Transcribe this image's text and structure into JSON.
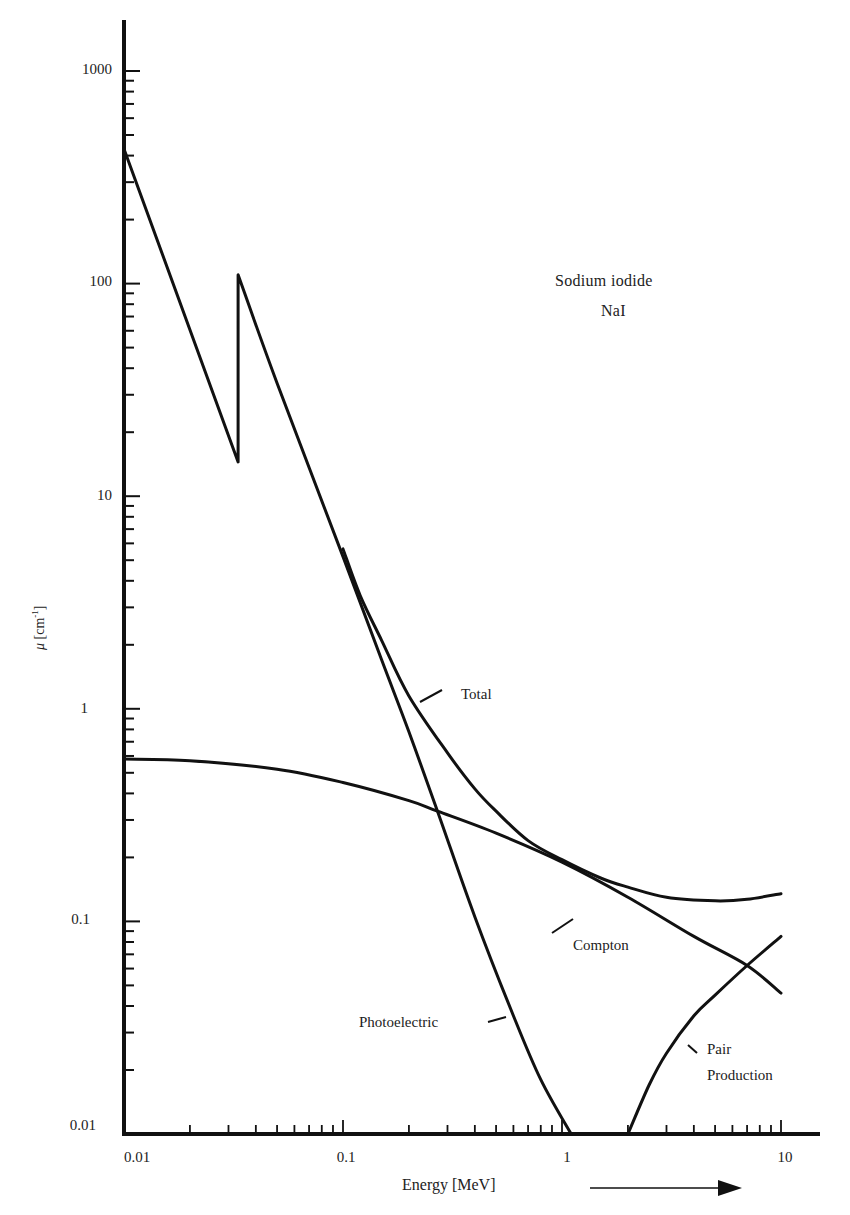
{
  "chart_data": {
    "type": "line",
    "title": "Sodium iodide",
    "subtitle": "NaI",
    "xlabel": "Energy [MeV]",
    "ylabel": "μ [cm⁻¹]",
    "xscale": "log",
    "yscale": "log",
    "xlim": [
      0.01,
      15
    ],
    "ylim": [
      0.01,
      1500
    ],
    "grid": false,
    "legend": "inline annotations",
    "x_tick_labels": [
      "0.01",
      "0.1",
      "1",
      "10"
    ],
    "y_tick_labels": [
      "0.01",
      "0.1",
      "1",
      "10",
      "100",
      "1000"
    ],
    "series": [
      {
        "name": "Photoelectric",
        "x": [
          0.01,
          0.0332,
          0.0332,
          0.05,
          0.1,
          0.15,
          0.2,
          0.27,
          0.4,
          0.6,
          0.8,
          1.1
        ],
        "y": [
          430,
          14.5,
          110,
          34,
          5.2,
          1.7,
          0.78,
          0.33,
          0.105,
          0.036,
          0.018,
          0.01
        ]
      },
      {
        "name": "Compton",
        "x": [
          0.01,
          0.02,
          0.05,
          0.1,
          0.2,
          0.27,
          0.5,
          1,
          2,
          4,
          7,
          10
        ],
        "y": [
          0.58,
          0.57,
          0.52,
          0.45,
          0.37,
          0.33,
          0.26,
          0.19,
          0.13,
          0.085,
          0.062,
          0.046
        ],
        "label": "Compton"
      },
      {
        "name": "Total",
        "x": [
          0.1,
          0.12,
          0.15,
          0.2,
          0.3,
          0.4,
          0.5,
          0.7,
          1,
          1.5,
          2,
          3,
          5,
          7,
          10
        ],
        "y": [
          5.65,
          3.4,
          2.1,
          1.15,
          0.62,
          0.42,
          0.33,
          0.24,
          0.195,
          0.16,
          0.145,
          0.13,
          0.125,
          0.127,
          0.135
        ]
      },
      {
        "name": "Pair Production",
        "x": [
          2.0,
          2.5,
          3,
          4,
          5,
          7,
          10
        ],
        "y": [
          0.01,
          0.017,
          0.024,
          0.036,
          0.045,
          0.062,
          0.085
        ]
      }
    ],
    "annotations": [
      {
        "text": "Total",
        "near": [
          0.22,
          1.05
        ]
      },
      {
        "text": "Compton",
        "near": [
          2.5,
          0.085
        ]
      },
      {
        "text": "Photoelectric",
        "near": [
          0.5,
          0.04
        ]
      },
      {
        "text": "Pair Production",
        "near": [
          3.5,
          0.03
        ]
      }
    ],
    "k_edge_MeV": 0.0332
  },
  "labels": {
    "title": "Sodium iodide",
    "subtitle": "NaI",
    "xlabel": "Energy [MeV]",
    "ylabel_mu": "μ",
    "ylabel_unit": "[cm",
    "ylabel_exp": "-1",
    "ylabel_close": "]",
    "total": "Total",
    "compton": "Compton",
    "photoelectric": "Photoelectric",
    "pair1": "Pair",
    "pair2": "Production",
    "y_ticks": [
      "1000",
      "100",
      "10",
      "1",
      "0.1",
      "0.01"
    ],
    "x_ticks": [
      "0.01",
      "0.1",
      "1",
      "10"
    ]
  }
}
